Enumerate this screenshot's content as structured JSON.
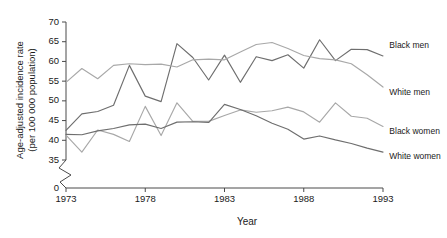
{
  "chart_data": {
    "type": "line",
    "title": "",
    "xlabel": "Year",
    "ylabel": "Age-adjusted incidence rate (per 100 000 population)",
    "ylabel_line1": "Age-adjusted incidence rate",
    "ylabel_line2": "(per 100 000 population)",
    "x": [
      1973,
      1974,
      1975,
      1976,
      1977,
      1978,
      1979,
      1980,
      1981,
      1982,
      1983,
      1984,
      1985,
      1986,
      1987,
      1988,
      1989,
      1990,
      1991,
      1992,
      1993
    ],
    "xlim": [
      1973,
      1993
    ],
    "xticks": [
      1973,
      1978,
      1983,
      1988,
      1993
    ],
    "xtick_labels": [
      "1973",
      "1978",
      "1983",
      "1988",
      "1993"
    ],
    "ylim": [
      35,
      70
    ],
    "yticks": [
      35,
      40,
      45,
      50,
      55,
      60,
      65,
      70
    ],
    "ytick_labels": [
      "35",
      "40",
      "45",
      "50",
      "55",
      "60",
      "65",
      "70"
    ],
    "y_axis_break": true,
    "y_origin_label": "0",
    "grid": false,
    "legend_position": "right-inline",
    "series": [
      {
        "name": "Black men",
        "color": "#6e6e6e",
        "label_x": 1993.4,
        "label_y": 64.0,
        "values": [
          42.5,
          46.7,
          47.3,
          48.9,
          59.0,
          51.2,
          49.8,
          64.5,
          61.0,
          55.3,
          61.6,
          54.7,
          61.2,
          60.2,
          61.7,
          58.3,
          65.5,
          60.2,
          63.1,
          63.0,
          61.4
        ]
      },
      {
        "name": "White men",
        "color": "#a8a8a8",
        "label_x": 1993.4,
        "label_y": 52.0,
        "values": [
          54.7,
          58.2,
          55.6,
          59.0,
          59.4,
          59.2,
          59.3,
          58.6,
          60.4,
          60.6,
          60.4,
          62.4,
          64.3,
          64.8,
          63.3,
          61.5,
          60.7,
          60.4,
          59.4,
          56.6,
          53.5
        ]
      },
      {
        "name": "Black women",
        "color": "#a8a8a8",
        "label_x": 1993.4,
        "label_y": 42.2,
        "values": [
          41.3,
          37.0,
          42.6,
          41.5,
          39.7,
          48.6,
          41.2,
          49.5,
          44.8,
          44.8,
          46.3,
          47.7,
          47.1,
          47.5,
          48.4,
          47.2,
          44.6,
          49.5,
          46.1,
          45.6,
          43.5
        ]
      },
      {
        "name": "White women",
        "color": "#6e6e6e",
        "label_x": 1993.4,
        "label_y": 35.8,
        "values": [
          41.5,
          41.4,
          42.4,
          43.0,
          43.9,
          44.1,
          43.0,
          44.6,
          44.7,
          44.5,
          49.1,
          47.8,
          46.2,
          44.3,
          42.8,
          40.3,
          41.1,
          40.1,
          39.2,
          38.0,
          37.0
        ]
      }
    ]
  }
}
